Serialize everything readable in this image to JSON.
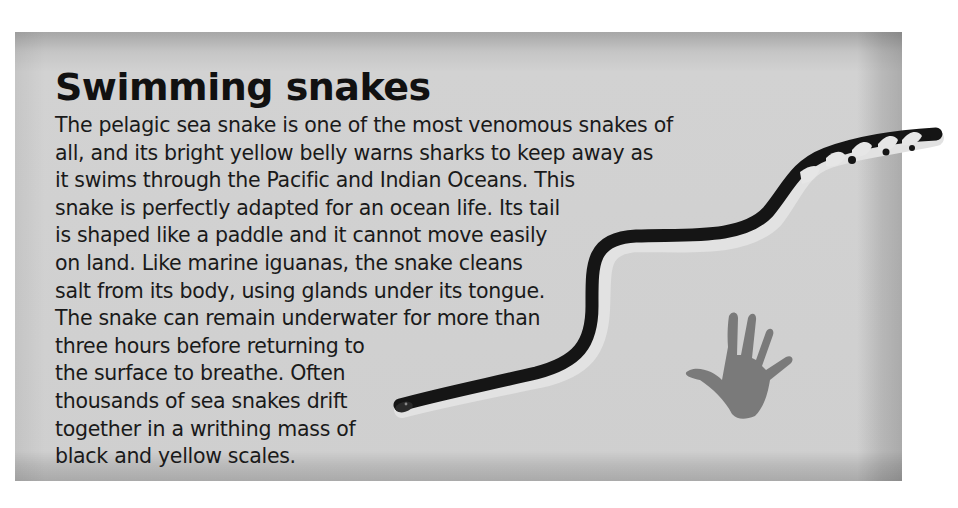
{
  "article": {
    "title": "Swimming snakes",
    "lines": [
      "The pelagic sea snake is one of the most venomous snakes of",
      "all, and its bright yellow belly warns sharks to keep away as",
      "it swims through the Pacific and Indian Oceans. This",
      "snake is perfectly adapted for an ocean life. Its tail",
      "is shaped like a paddle and it cannot move easily",
      "on land. Like marine iguanas, the snake cleans",
      "salt from its body, using glands under its tongue.",
      "The snake can remain underwater for more than",
      "three hours before returning to",
      "the surface to breathe. Often",
      "thousands of sea snakes drift",
      "together in a writhing mass of",
      "black and yellow scales."
    ]
  },
  "illustrations": {
    "snake": "pelagic-sea-snake",
    "hand": "hand-print-scale-icon"
  },
  "colors": {
    "panel": "#cfcfcf",
    "text": "#1a1a1a",
    "snake_back": "#141414",
    "snake_belly": "#e4e4e4",
    "hand": "#7a7a7a"
  }
}
